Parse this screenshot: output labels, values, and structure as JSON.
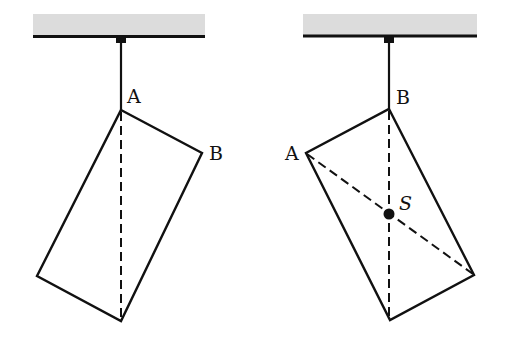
{
  "colors": {
    "ceiling_fill": "#dcdcdc",
    "line": "#111111",
    "background": "#ffffff"
  },
  "figures": [
    {
      "name": "left",
      "labels": {
        "top": "A",
        "side": "B"
      },
      "description": "Rectangle suspended from corner A; dashed vertical line through A"
    },
    {
      "name": "right",
      "labels": {
        "top": "B",
        "side": "A",
        "center": "S"
      },
      "description": "Rectangle suspended from corner B; dashed vertical line through B and dashed diagonal from A intersect at center of mass S"
    }
  ]
}
